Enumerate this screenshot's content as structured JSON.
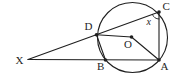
{
  "figure": {
    "type": "circle-theorem-diagram",
    "point_labels": {
      "X": "X",
      "D": "D",
      "B": "B",
      "O": "O",
      "A": "A",
      "C": "C"
    },
    "angle_label": "x",
    "colors": {
      "line": "#1f1f1f",
      "background": "#ffffff"
    }
  }
}
